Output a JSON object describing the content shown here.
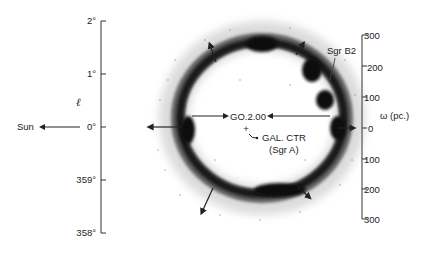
{
  "diagram": {
    "left_axis": {
      "symbol": "ℓ",
      "ticks": [
        "2°",
        "1°",
        "0°",
        "359°",
        "358°"
      ]
    },
    "right_axis": {
      "label": "ω (pc.)",
      "ticks": [
        "300",
        "200",
        "100",
        "0",
        "100",
        "200",
        "300"
      ]
    },
    "labels": {
      "sun": "Sun",
      "center_source": "GO.2.00",
      "galactic_center": "GAL. CTR",
      "galactic_center_sub": "(Sgr A)",
      "sgr_b2": "Sgr B2"
    },
    "colors": {
      "ink": "#222222",
      "ring": "#111111",
      "background": "#ffffff"
    }
  }
}
